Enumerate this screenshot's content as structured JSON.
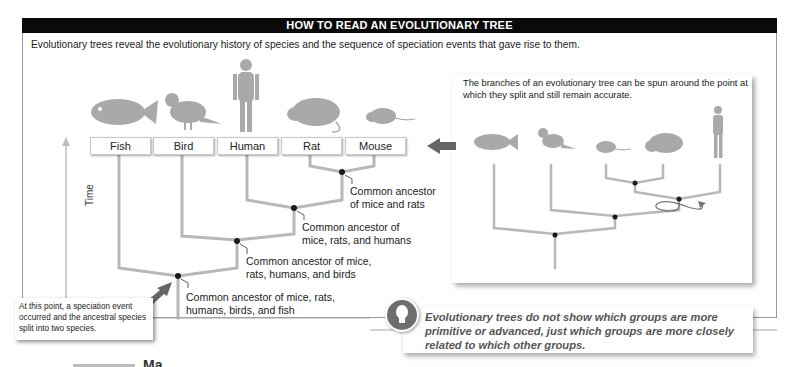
{
  "header": {
    "title": "HOW TO READ AN EVOLUTIONARY TREE"
  },
  "intro": "Evolutionary trees reveal the evolutionary history of species and the sequence of speciation events that gave rise to them.",
  "main_tree": {
    "axis_label": "Time",
    "taxa": [
      "Fish",
      "Bird",
      "Human",
      "Rat",
      "Mouse"
    ],
    "ancestors": [
      {
        "line1": "Common ancestor",
        "line2": "of mice and rats"
      },
      {
        "line1": "Common ancestor of",
        "line2": "mice, rats, and humans"
      },
      {
        "line1": "Common ancestor of mice,",
        "line2": "rats, humans, and birds"
      },
      {
        "line1": "Common ancestor of mice, rats,",
        "line2": "humans, birds, and fish"
      }
    ],
    "callout": "At this point, a speciation event occurred and the ancestral species split into two species."
  },
  "inset": {
    "text": "The branches of an evolutionary tree can be spun around the point at which they split and still remain accurate.",
    "order": [
      "Fish",
      "Bird",
      "Mouse",
      "Rat",
      "Human"
    ]
  },
  "note": {
    "icon": "lightbulb-icon",
    "text": "Evolutionary trees do not show which groups are more primitive or advanced, just which groups are more closely related to which other groups."
  },
  "bottom_fragment": {
    "text": "Ma"
  },
  "colors": {
    "branch": "#b8b8b8",
    "node": "#1a1a1a",
    "silhouette": "#a9a9a9",
    "header_bg": "#0a0a0a",
    "arrow": "#6a6a6a"
  }
}
